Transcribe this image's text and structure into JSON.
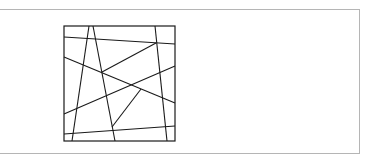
{
  "figure": {
    "type": "line-partition-diagram",
    "frame_color": "#b5b5b5",
    "stroke_color": "#1a1a1a",
    "square": {
      "x": 64,
      "y": 26,
      "width": 111,
      "height": 115
    },
    "segments": [
      {
        "id": "v1",
        "x1": 89,
        "y1": 26,
        "x2": 72,
        "y2": 141
      },
      {
        "id": "v2",
        "x1": 93,
        "y1": 26,
        "x2": 115,
        "y2": 141
      },
      {
        "id": "v3",
        "x1": 155,
        "y1": 26,
        "x2": 167,
        "y2": 141
      },
      {
        "id": "h1",
        "x1": 64,
        "y1": 37,
        "x2": 175,
        "y2": 44
      },
      {
        "id": "d1",
        "x1": 64,
        "y1": 57,
        "x2": 175,
        "y2": 103
      },
      {
        "id": "d2",
        "x1": 102,
        "y1": 72,
        "x2": 156,
        "y2": 43
      },
      {
        "id": "d3",
        "x1": 64,
        "y1": 114,
        "x2": 175,
        "y2": 66
      },
      {
        "id": "d4",
        "x1": 141,
        "y1": 89,
        "x2": 112,
        "y2": 127
      },
      {
        "id": "h2",
        "x1": 64,
        "y1": 134,
        "x2": 175,
        "y2": 126
      }
    ]
  }
}
